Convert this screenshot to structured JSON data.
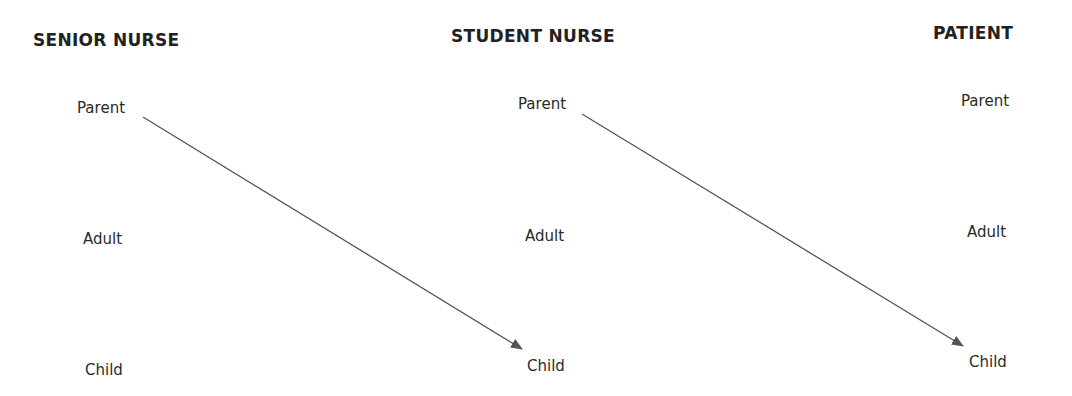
{
  "columns": [
    {
      "title": "SENIOR NURSE",
      "states": [
        "Parent",
        "Adult",
        "Child"
      ]
    },
    {
      "title": "STUDENT NURSE",
      "states": [
        "Parent",
        "Adult",
        "Child"
      ]
    },
    {
      "title": "PATIENT",
      "states": [
        "Parent",
        "Adult",
        "Child"
      ]
    }
  ],
  "arrows": [
    {
      "from": "Senior Nurse Parent",
      "to": "Student Nurse Child"
    },
    {
      "from": "Student Nurse Parent",
      "to": "Patient Child"
    }
  ],
  "colors": {
    "line": "#555555",
    "text": "#2a2a2a"
  }
}
